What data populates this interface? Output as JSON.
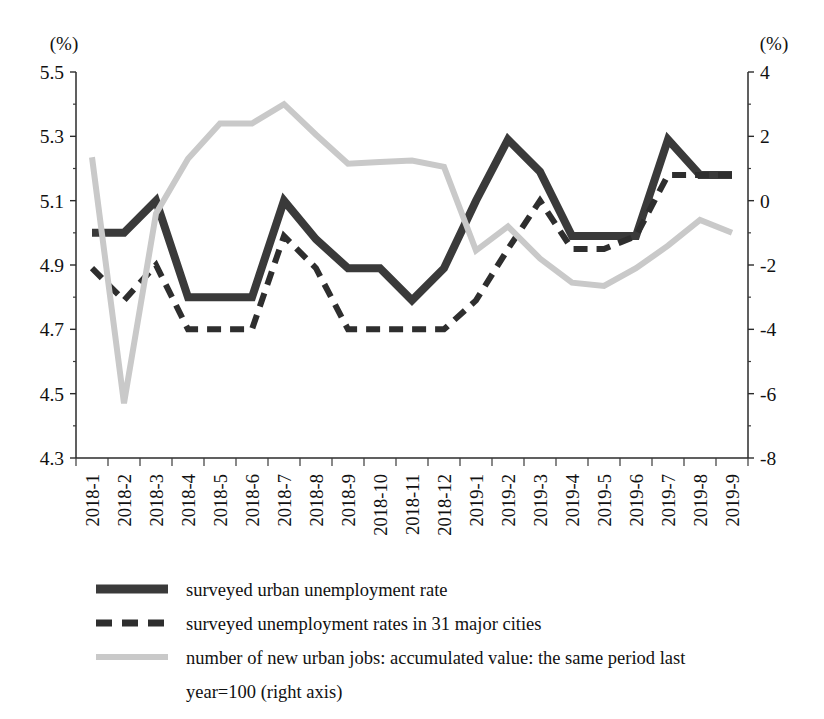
{
  "chart_data": {
    "type": "line",
    "title": "",
    "xlabel": "",
    "ylabel": "(%)",
    "y2label": "(%)",
    "grid": false,
    "legend_position": "bottom-left",
    "left_axis_unit": "(%)",
    "right_axis_unit": "(%)",
    "ylim": [
      4.3,
      5.5
    ],
    "y2lim": [
      -8,
      4
    ],
    "yticks": [
      "4.3",
      "4.5",
      "4.7",
      "4.9",
      "5.1",
      "5.3",
      "5.5"
    ],
    "ytick_values": [
      4.3,
      4.5,
      4.7,
      4.9,
      5.1,
      5.3,
      5.5
    ],
    "y2ticks": [
      "-8",
      "-6",
      "-4",
      "-2",
      "0",
      "2",
      "4"
    ],
    "y2tick_values": [
      -8,
      -6,
      -4,
      -2,
      0,
      2,
      4
    ],
    "categories": [
      "2018-1",
      "2018-2",
      "2018-3",
      "2018-4",
      "2018-5",
      "2018-6",
      "2018-7",
      "2018-8",
      "2018-9",
      "2018-10",
      "2018-11",
      "2018-12",
      "2019-1",
      "2019-2",
      "2019-3",
      "2019-4",
      "2019-5",
      "2019-6",
      "2019-7",
      "2019-8",
      "2019-9"
    ],
    "series": [
      {
        "name": "surveyed urban unemployment rate",
        "axis": "left",
        "style": "solid",
        "color": "#3a3a3a",
        "width": 8,
        "values": [
          5.0,
          5.0,
          5.1,
          4.8,
          4.8,
          4.8,
          5.1,
          4.98,
          4.89,
          4.89,
          4.79,
          4.89,
          5.1,
          5.29,
          5.19,
          4.99,
          4.99,
          4.99,
          5.29,
          5.18,
          5.18
        ]
      },
      {
        "name": "surveyed unemployment rates in 31 major cities",
        "axis": "left",
        "style": "dashed",
        "color": "#2e2e2e",
        "width": 6,
        "values": [
          4.89,
          4.79,
          4.9,
          4.7,
          4.7,
          4.7,
          4.99,
          4.89,
          4.7,
          4.7,
          4.7,
          4.7,
          4.79,
          4.95,
          5.1,
          4.95,
          4.95,
          4.99,
          5.18,
          5.18,
          5.18
        ]
      },
      {
        "name": "number of new urban jobs: accumulated value: the same period last year=100 (right axis)",
        "axis": "right",
        "style": "solid",
        "color": "#c9c9c9",
        "width": 6,
        "values": [
          1.35,
          -6.3,
          -0.4,
          1.3,
          2.4,
          2.4,
          3.0,
          2.05,
          1.15,
          1.2,
          1.25,
          1.05,
          -1.55,
          -0.8,
          -1.8,
          -2.55,
          -2.65,
          -2.1,
          -1.4,
          -0.6,
          -1.0
        ]
      }
    ],
    "legend": [
      {
        "label": "surveyed urban unemployment rate",
        "style": "solid",
        "color": "#3a3a3a"
      },
      {
        "label": "surveyed unemployment rates in 31 major cities",
        "style": "dashed",
        "color": "#2e2e2e"
      },
      {
        "label": "number of new urban jobs: accumulated value: the same period last",
        "label_line2": "year=100 (right axis)",
        "style": "solid",
        "color": "#c9c9c9"
      }
    ]
  }
}
